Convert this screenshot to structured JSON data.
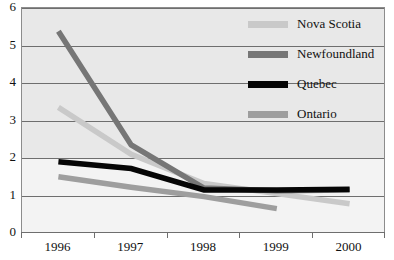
{
  "chart_data": {
    "type": "line",
    "title": "",
    "xlabel": "",
    "ylabel": "",
    "categories": [
      "1996",
      "1997",
      "1998",
      "1999",
      "2000"
    ],
    "ylim": [
      0,
      6
    ],
    "y_ticks": [
      "0",
      "1",
      "2",
      "3",
      "4",
      "5",
      "6"
    ],
    "grid": true,
    "legend_position": "top-right",
    "series": [
      {
        "name": "Nova Scotia",
        "color": "#c9c9c9",
        "values": [
          3.35,
          2.1,
          1.32,
          1.05,
          0.78
        ]
      },
      {
        "name": "Newfoundland",
        "color": "#767676",
        "values": [
          5.38,
          2.35,
          1.2,
          1.13,
          1.15
        ]
      },
      {
        "name": "Quebec",
        "color": "#050505",
        "values": [
          1.9,
          1.72,
          1.15,
          1.15,
          1.17
        ]
      },
      {
        "name": "Ontario",
        "color": "#9e9e9e",
        "values": [
          1.5,
          1.22,
          0.97,
          0.65,
          null
        ]
      }
    ]
  },
  "legend": {
    "items": [
      {
        "label": "Nova Scotia",
        "color": "#c9c9c9"
      },
      {
        "label": "Newfoundland",
        "color": "#767676"
      },
      {
        "label": "Quebec",
        "color": "#050505"
      },
      {
        "label": "Ontario",
        "color": "#9e9e9e"
      }
    ]
  },
  "axes": {
    "y_tick_labels": [
      "6",
      "5",
      "4",
      "3",
      "2",
      "1",
      "0"
    ],
    "x_tick_labels": [
      "1996",
      "1997",
      "1998",
      "1999",
      "2000"
    ]
  },
  "colors": {
    "plot_background": "#ececec",
    "gridline": "#6e6e6e",
    "frame": "#8c8c8c",
    "text": "#111111",
    "page_background": "#ffffff"
  }
}
